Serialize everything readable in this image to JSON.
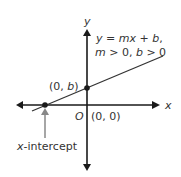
{
  "diagram": {
    "equation_line1": "y = mx + b,",
    "equation_line2": "m > 0, b > 0",
    "y_axis_label": "y",
    "x_axis_label": "x",
    "origin_label": "O",
    "origin_coords": "(0, 0)",
    "y_intercept_label": "(0, b)",
    "x_intercept_label": "x-intercept",
    "colors": {
      "axes": "#1a1a1a",
      "line": "#333333",
      "arrow_pointer": "#888888",
      "text": "#333333"
    }
  }
}
